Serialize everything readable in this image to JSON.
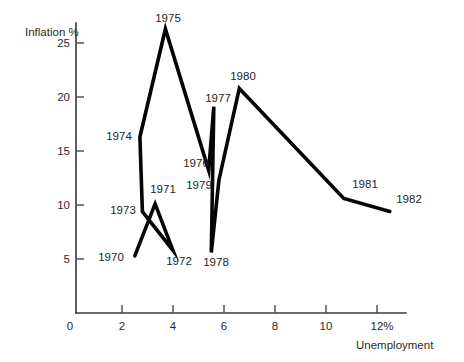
{
  "chart_data": {
    "type": "line",
    "title": "",
    "subtitle": "",
    "xlabel": "Unemployment",
    "ylabel": "Inflation %",
    "xlim": [
      0,
      13
    ],
    "ylim": [
      0,
      27
    ],
    "grid": false,
    "legend": "none",
    "series": [
      {
        "name": "UK inflation vs unemployment 1970-1982",
        "x": [
          2.5,
          3.3,
          4.0,
          2.8,
          2.7,
          3.7,
          5.4,
          5.6,
          5.5,
          5.8,
          6.6,
          10.7,
          12.5
        ],
        "y": [
          5.3,
          10.1,
          5.8,
          9.4,
          16.3,
          26.3,
          13.2,
          19.1,
          5.6,
          12.3,
          20.8,
          10.6,
          9.4
        ],
        "point_labels": [
          "1970",
          "1971",
          "1972",
          "1973",
          "1974",
          "1975",
          "1976",
          "1977",
          "1978",
          "1979",
          "1980",
          "1981",
          "1982"
        ]
      }
    ],
    "xticks": [
      {
        "value": 0,
        "label": "0"
      },
      {
        "value": 2,
        "label": "2"
      },
      {
        "value": 4,
        "label": "4"
      },
      {
        "value": 6,
        "label": "6"
      },
      {
        "value": 8,
        "label": "8"
      },
      {
        "value": 10,
        "label": "10"
      },
      {
        "value": 12,
        "label": "12%"
      }
    ],
    "yticks": [
      {
        "value": 5,
        "label": "5"
      },
      {
        "value": 10,
        "label": "10"
      },
      {
        "value": 15,
        "label": "15"
      },
      {
        "value": 20,
        "label": "20"
      },
      {
        "value": 25,
        "label": "25"
      }
    ],
    "colors": {
      "line": "#050505",
      "axis": "#3a3a3a",
      "text": "#2b2b2b",
      "background": "#ffffff"
    }
  },
  "labels": {
    "y_axis_title": "Inflation %",
    "x_axis_title": "Unemployment",
    "origin": "0",
    "y_25": "25",
    "y_20": "20",
    "y_15": "15",
    "y_10": "10",
    "y_5": "5",
    "x_2": "2",
    "x_4": "4",
    "x_6": "6",
    "x_8": "8",
    "x_10": "10",
    "x_12": "12%",
    "p1970": "1970",
    "p1971": "1971",
    "p1972": "1972",
    "p1973": "1973",
    "p1974": "1974",
    "p1975": "1975",
    "p1976": "1976",
    "p1977": "1977",
    "p1978": "1978",
    "p1979": "1979",
    "p1980": "1980",
    "p1981": "1981",
    "p1982": "1982"
  }
}
